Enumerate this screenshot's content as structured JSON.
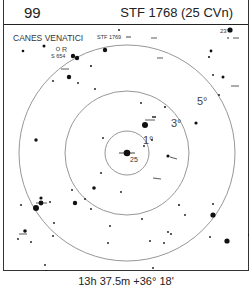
{
  "header": {
    "page_number": "99",
    "title": "STF 1768 (25 CVn)"
  },
  "chart": {
    "constellation_label": "CANES VENATICI",
    "center_star_label": "25",
    "labels": {
      "variable_R": "R",
      "stf1769": "STF 1769",
      "s654": "S 654",
      "star_23": "23"
    },
    "circles": [
      {
        "label": "1°",
        "radius": 22
      },
      {
        "label": "3°",
        "radius": 62
      },
      {
        "label": "5°",
        "radius": 108
      }
    ],
    "colors": {
      "circle": "#8a8a8a",
      "star": "#111111",
      "border": "#222222"
    }
  },
  "footer": {
    "coordinates": "13h 37.5m  +36° 18'"
  }
}
